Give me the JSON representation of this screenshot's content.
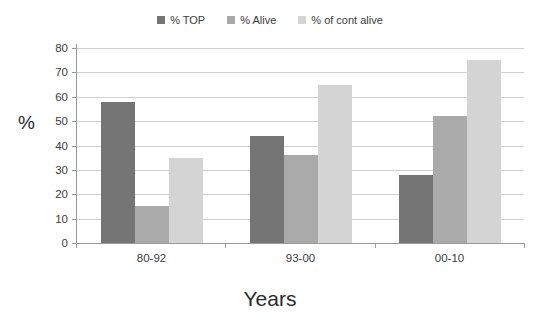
{
  "chart_data": {
    "type": "bar",
    "title": "",
    "xlabel": "Years",
    "ylabel": "%",
    "categories": [
      "80-92",
      "93-00",
      "00-10"
    ],
    "series": [
      {
        "name": "% TOP",
        "color": "#757575",
        "values": [
          58,
          44,
          28
        ]
      },
      {
        "name": "% Alive",
        "color": "#aaaaaa",
        "values": [
          15,
          36,
          52
        ]
      },
      {
        "name": "% of cont alive",
        "color": "#d4d4d4",
        "values": [
          35,
          65,
          75
        ]
      }
    ],
    "ylim": [
      0,
      80
    ],
    "yticks": [
      80,
      70,
      60,
      50,
      40,
      30,
      20,
      10,
      0
    ],
    "grid": true,
    "legend_position": "top-center"
  }
}
